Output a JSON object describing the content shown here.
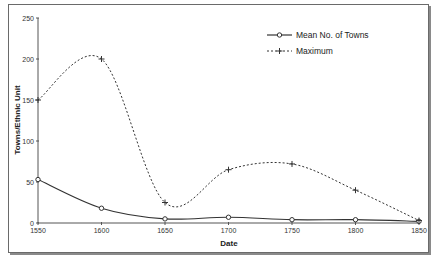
{
  "chart_data": {
    "type": "line",
    "title": "",
    "xlabel": "Date",
    "ylabel": "Towns/Ethnic Unit",
    "categories": [
      "1550",
      "1600",
      "1650",
      "1700",
      "1750",
      "1800",
      "1850"
    ],
    "x": [
      1550,
      1600,
      1650,
      1700,
      1750,
      1800,
      1850
    ],
    "ylim": [
      0,
      250
    ],
    "yticks": [
      0,
      50,
      100,
      150,
      200,
      250
    ],
    "grid": false,
    "legend_position": "upper right",
    "smoothed": true,
    "series": [
      {
        "name": "Mean No. of Towns",
        "style": "solid",
        "marker": "circle",
        "values": [
          53,
          18,
          5,
          7,
          4,
          4,
          2
        ]
      },
      {
        "name": "Maximum",
        "style": "dotted",
        "marker": "plus",
        "values": [
          150,
          200,
          25,
          65,
          72,
          40,
          3
        ]
      }
    ]
  },
  "legend": {
    "items": [
      {
        "label": "Mean No. of Towns"
      },
      {
        "label": "Maximum"
      }
    ]
  },
  "colors": {
    "line": "#333333",
    "axis": "#555555",
    "frame": "#6a6a6a"
  }
}
